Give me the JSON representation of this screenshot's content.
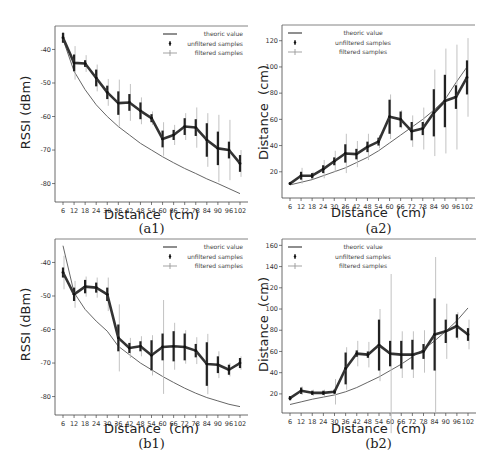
{
  "chart_data": [
    {
      "id": "a1",
      "type": "line",
      "caption": "(a1)",
      "xlabel": "Distance  (cm)",
      "ylabel": "RSSI (dBm)",
      "categories": [
        6,
        12,
        18,
        24,
        30,
        36,
        42,
        48,
        54,
        60,
        66,
        72,
        78,
        84,
        90,
        96,
        102
      ],
      "ylim": [
        -85.5,
        -33
      ],
      "yticks": [
        -40,
        -50,
        -60,
        -70,
        -80
      ],
      "legend": [
        "theoric value",
        "unfiltered samples",
        "filtered samples"
      ],
      "legend_position": "upper right",
      "series": [
        {
          "name": "theoric value",
          "values": [
            -37,
            -46.5,
            -52,
            -56.5,
            -60,
            -63,
            -65.5,
            -68,
            -70,
            -72,
            -73.8,
            -75.5,
            -77,
            -78.6,
            -80,
            -81.5,
            -83
          ]
        },
        {
          "name": "filtered samples",
          "values": [
            -36.5,
            -44,
            -44.2,
            -48.5,
            -52.8,
            -56,
            -55.8,
            -58.3,
            -60.5,
            -66.7,
            -65.5,
            -63,
            -63.3,
            -67,
            -69.5,
            -70,
            -74
          ],
          "err": [
            1.5,
            2.5,
            1,
            2.5,
            2,
            3.5,
            2.5,
            2.5,
            1.2,
            2.5,
            1.5,
            2.5,
            2.5,
            5,
            5,
            2.5,
            2.5
          ],
          "unfiltered_err": [
            1.5,
            5,
            2.5,
            4,
            4,
            7,
            5.5,
            4,
            2,
            5,
            3,
            4,
            6,
            8,
            10,
            9,
            4
          ]
        }
      ]
    },
    {
      "id": "a2",
      "type": "line",
      "caption": "(a2)",
      "xlabel": "Distance  (cm)",
      "ylabel": "Distance  (cm)",
      "categories": [
        6,
        12,
        18,
        24,
        30,
        36,
        42,
        48,
        54,
        60,
        66,
        72,
        78,
        84,
        90,
        96,
        102
      ],
      "ylim": [
        0,
        132
      ],
      "yticks": [
        20,
        40,
        60,
        80,
        100,
        120
      ],
      "legend": [
        "theoric value",
        "unfiltered samples",
        "filtered samples"
      ],
      "legend_position": "upper left",
      "series": [
        {
          "name": "theoric value",
          "values": [
            10,
            12,
            14,
            17,
            20,
            23,
            27,
            31,
            36,
            42,
            48,
            54,
            60,
            67,
            75,
            88,
            100
          ]
        },
        {
          "name": "filtered samples",
          "values": [
            11,
            17,
            17,
            22,
            28,
            34,
            33.5,
            39,
            43,
            62,
            60,
            51,
            53,
            65,
            74,
            77,
            92
          ],
          "err": [
            1,
            3,
            2,
            3,
            3,
            7,
            4,
            4,
            3,
            13,
            6,
            7,
            5,
            18,
            20,
            9,
            13
          ],
          "unfiltered_err": [
            1,
            6,
            3,
            7,
            8,
            15,
            10,
            10,
            5,
            17,
            7,
            12,
            16,
            33,
            40,
            40,
            30
          ]
        }
      ]
    },
    {
      "id": "b1",
      "type": "line",
      "caption": "(b1)",
      "xlabel": "Distance  (cm)",
      "ylabel": "RSSI (dBm)",
      "categories": [
        6,
        12,
        18,
        24,
        30,
        36,
        42,
        48,
        54,
        60,
        66,
        72,
        78,
        84,
        90,
        96,
        102
      ],
      "ylim": [
        -85.5,
        -33
      ],
      "yticks": [
        -40,
        -50,
        -60,
        -70,
        -80
      ],
      "legend": [
        "theoric value",
        "unfiltered samples",
        "filtered samples"
      ],
      "legend_position": "upper right",
      "series": [
        {
          "name": "theoric value",
          "values": [
            -35,
            -49,
            -54,
            -57.5,
            -60.5,
            -65,
            -67.5,
            -70,
            -72,
            -74,
            -75.8,
            -77.5,
            -79,
            -80.3,
            -81.3,
            -82.3,
            -83
          ]
        },
        {
          "name": "filtered samples",
          "values": [
            -43,
            -49.5,
            -47.2,
            -47.5,
            -49.5,
            -62.5,
            -65.5,
            -65,
            -67.7,
            -65.2,
            -65,
            -65.2,
            -66.3,
            -70.3,
            -70.5,
            -72,
            -70
          ],
          "err": [
            1.5,
            2,
            2,
            1.5,
            2,
            4,
            1.5,
            1.5,
            4.5,
            4,
            4.5,
            4,
            2,
            6.5,
            2.5,
            1.5,
            1.5
          ],
          "unfiltered_err": [
            5,
            4,
            3,
            3,
            5,
            10,
            3,
            3,
            6,
            14,
            7,
            5,
            4,
            9,
            4,
            2,
            2
          ]
        }
      ]
    },
    {
      "id": "b2",
      "type": "line",
      "caption": "(b2)",
      "xlabel": "Distance  (cm)",
      "ylabel": "Distance  (cm)",
      "categories": [
        6,
        12,
        18,
        24,
        30,
        36,
        42,
        48,
        54,
        60,
        66,
        72,
        78,
        84,
        90,
        96,
        102
      ],
      "ylim": [
        2,
        166
      ],
      "yticks": [
        20,
        40,
        60,
        80,
        100,
        120,
        140,
        160
      ],
      "legend": [
        "theoric value",
        "unfiltered samples",
        "filtered samples"
      ],
      "legend_position": "upper left",
      "series": [
        {
          "name": "theoric value",
          "values": [
            10,
            12.5,
            15,
            17,
            19,
            22,
            26,
            31,
            36,
            42,
            48,
            55,
            62,
            70,
            79,
            89,
            101
          ]
        },
        {
          "name": "filtered samples",
          "values": [
            16,
            23,
            21,
            21,
            22,
            44,
            58,
            57,
            66,
            58,
            57,
            57,
            60,
            76,
            79,
            84,
            76
          ],
          "err": [
            2,
            3,
            2,
            2,
            2,
            15,
            3,
            3,
            24,
            12,
            13,
            14,
            7,
            34,
            11,
            11,
            6
          ],
          "unfiltered_err": [
            2,
            4,
            3,
            3,
            12,
            20,
            12,
            12,
            34,
            75,
            22,
            22,
            20,
            73,
            26,
            13,
            14
          ]
        }
      ]
    }
  ]
}
